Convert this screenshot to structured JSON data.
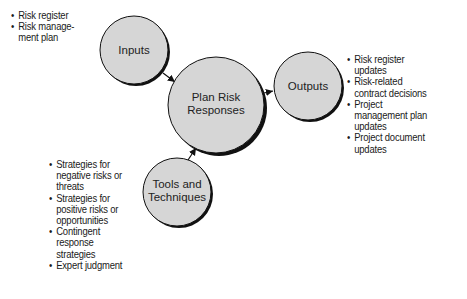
{
  "nodes": {
    "inputs": {
      "label": "Inputs"
    },
    "process": {
      "label_line1": "Plan Risk",
      "label_line2": "Responses"
    },
    "outputs": {
      "label": "Outputs"
    },
    "tools": {
      "label_line1": "Tools and",
      "label_line2": "Techniques"
    }
  },
  "lists": {
    "inputs": [
      "Risk register",
      "Risk manage-\nment plan"
    ],
    "outputs": [
      "Risk register updates",
      "Risk-related contract decisions",
      "Project management plan updates",
      "Project document updates"
    ],
    "tools": [
      "Strategies for negative risks or threats",
      "Strategies for positive risks or opportunities",
      "Contingent response strategies",
      "Expert judgment"
    ]
  },
  "colors": {
    "circle_fill": "#d6d6d6",
    "circle_stroke": "#111111",
    "shadow": "#111111"
  }
}
